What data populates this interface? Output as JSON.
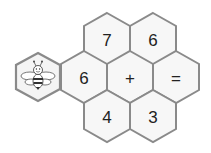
{
  "puzzle": {
    "mascot": "bee-icon",
    "cells": [
      {
        "id": "top-left",
        "value": "7"
      },
      {
        "id": "top-right",
        "value": "6"
      },
      {
        "id": "middle-left",
        "value": "6"
      },
      {
        "id": "middle-center",
        "value": "+"
      },
      {
        "id": "middle-right",
        "value": "="
      },
      {
        "id": "bottom-left",
        "value": "4"
      },
      {
        "id": "bottom-right",
        "value": "3"
      }
    ]
  },
  "colors": {
    "border": "#8a8a8a",
    "fill": "#f7f7f7",
    "text": "#222222"
  }
}
